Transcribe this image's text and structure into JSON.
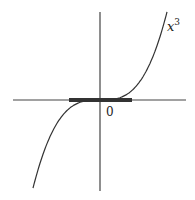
{
  "figure": {
    "width": 195,
    "height": 200,
    "background": "#ffffff",
    "stroke_color": "#333333",
    "origin": {
      "x": 100,
      "y": 100
    },
    "x_axis": {
      "x1": 13,
      "x2": 186,
      "y": 100
    },
    "y_axis": {
      "x": 100,
      "y1": 12,
      "y2": 191
    },
    "highlight_segment": {
      "x1": 69,
      "x2": 132,
      "y": 100,
      "width": 4,
      "color": "#333333"
    },
    "curve": {
      "function": "x^3",
      "x_start": 33,
      "x_end": 167,
      "scale_k": 0.000293
    },
    "labels": {
      "function_base": "x",
      "function_exp": "3",
      "origin": "0"
    }
  },
  "chart_data": {
    "type": "line",
    "title": "",
    "series": [
      {
        "name": "x^3",
        "x": [
          -1.0,
          -0.75,
          -0.5,
          -0.25,
          0,
          0.25,
          0.5,
          0.75,
          1.0
        ],
        "values": [
          -1.0,
          -0.42,
          -0.125,
          -0.016,
          0,
          0.016,
          0.125,
          0.42,
          1.0
        ]
      }
    ],
    "annotations": [
      "x^3",
      "0"
    ],
    "highlighted_interval_on_x_axis": [
      -0.47,
      0.47
    ],
    "xlabel": "",
    "ylabel": "",
    "grid": false
  }
}
